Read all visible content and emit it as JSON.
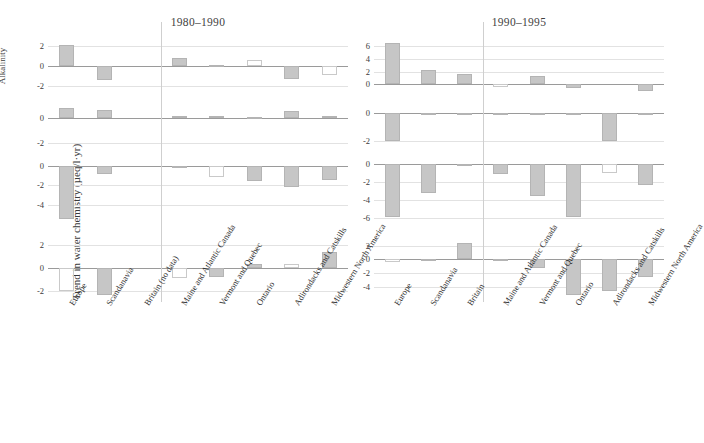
{
  "figure": {
    "ylabel": "Trend in water chemistry (µeq/l·yr)",
    "panels": [
      {
        "key": "left",
        "title": "1980–1990"
      },
      {
        "key": "right",
        "title": "1990–1995"
      }
    ],
    "row_labels": [
      "Alkalinity",
      "NO3-",
      "SO42-",
      "CB"
    ],
    "divider_after_category_index": 2,
    "colors": {
      "bar_fill": "#c6c6c6",
      "bar_edge": "#b4b4b4",
      "hollow_edge": "#c9c9c9",
      "grid": "#e2e2e2",
      "zero_axis": "#9a9a9a",
      "divider": "#cfcfcf",
      "text": "#3b3b3b"
    }
  },
  "chart_data": [
    {
      "type": "bar",
      "title": "1980–1990",
      "xlabel": "",
      "ylabel": "Trend in water chemistry (µeq/l·yr)",
      "categories": [
        "Europe",
        "Scandanavia",
        "Britain (no data)",
        "Maine and Atlantic Canada",
        "Vermont and Quebec",
        "Ontario",
        "Adirondacks and Catskills",
        "Midwestern North America"
      ],
      "subplots": [
        {
          "name": "Alkalinity",
          "ylim": [
            -2.6,
            2.6
          ],
          "yticks": [
            -2,
            0,
            2
          ],
          "values": [
            2.1,
            -1.4,
            null,
            0.8,
            0.15,
            0.65,
            -1.3,
            -0.85
          ],
          "styles": [
            "filled",
            "filled",
            "none",
            "filled",
            "filled",
            "hollow",
            "filled",
            "hollow"
          ]
        },
        {
          "name": "NO3-",
          "ylim": [
            -2.6,
            1.1
          ],
          "yticks": [
            -2,
            0
          ],
          "values": [
            0.75,
            0.6,
            null,
            0.1,
            0.12,
            0.08,
            0.5,
            0.1
          ],
          "styles": [
            "filled",
            "filled",
            "none",
            "filled",
            "filled",
            "filled",
            "filled",
            "filled"
          ]
        },
        {
          "name": "SO42-",
          "ylim": [
            -5.8,
            0.6
          ],
          "yticks": [
            -4,
            -2,
            0
          ],
          "values": [
            -5.5,
            -0.8,
            null,
            -0.1,
            -1.2,
            -1.6,
            -2.2,
            -1.5
          ],
          "styles": [
            "filled",
            "filled",
            "none",
            "filled",
            "hollow",
            "filled",
            "filled",
            "filled"
          ]
        },
        {
          "name": "CB",
          "ylim": [
            -2.6,
            2.4
          ],
          "yticks": [
            -2,
            0,
            2
          ],
          "values": [
            -2.0,
            -2.3,
            null,
            -0.9,
            -0.8,
            0.3,
            0.35,
            1.4
          ],
          "styles": [
            "hollow",
            "filled",
            "none",
            "hollow",
            "filled",
            "filled",
            "hollow",
            "filled"
          ]
        }
      ]
    },
    {
      "type": "bar",
      "title": "1990–1995",
      "xlabel": "",
      "ylabel": "Trend in water chemistry (µeq/l·yr)",
      "categories": [
        "Europe",
        "Scandanavia",
        "Britain",
        "Maine and Atlantic Canada",
        "Vermont and Quebec",
        "Ontario",
        "Adirondacks and Catskills",
        "Midwestern North America"
      ],
      "subplots": [
        {
          "name": "Alkalinity",
          "ylim": [
            -1.2,
            7.0
          ],
          "yticks": [
            0,
            2,
            4,
            6
          ],
          "values": [
            6.5,
            2.2,
            1.6,
            -0.35,
            1.3,
            -0.55,
            0.0,
            -1.0
          ],
          "styles": [
            "filled",
            "filled",
            "filled",
            "hollow",
            "filled",
            "filled",
            "none",
            "filled"
          ]
        },
        {
          "name": "NO3-",
          "ylim": [
            -2.6,
            0.6
          ],
          "yticks": [
            -2,
            0
          ],
          "values": [
            -2.0,
            -0.08,
            -0.1,
            -0.07,
            -0.07,
            -0.06,
            -2.0,
            -0.07
          ],
          "styles": [
            "filled",
            "filled",
            "filled",
            "filled",
            "filled",
            "filled",
            "filled",
            "filled"
          ]
        },
        {
          "name": "SO42-",
          "ylim": [
            -6.4,
            0.5
          ],
          "yticks": [
            -6,
            -4,
            -2,
            0
          ],
          "values": [
            -5.8,
            -3.2,
            -0.05,
            -1.1,
            -3.5,
            -5.8,
            -0.9,
            -2.3
          ],
          "styles": [
            "filled",
            "filled",
            "filled",
            "filled",
            "filled",
            "filled",
            "hollow",
            "filled"
          ]
        },
        {
          "name": "CB",
          "ylim": [
            -5.6,
            2.8
          ],
          "yticks": [
            -4,
            -2,
            0,
            2
          ],
          "values": [
            -0.4,
            -0.2,
            2.3,
            -0.1,
            -1.3,
            -5.2,
            -4.6,
            -2.5
          ],
          "styles": [
            "hollow",
            "filled",
            "filled",
            "filled",
            "filled",
            "filled",
            "filled",
            "filled"
          ]
        }
      ]
    }
  ]
}
